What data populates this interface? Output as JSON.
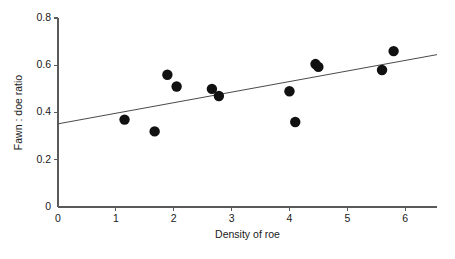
{
  "chart_data": {
    "type": "scatter",
    "title": "",
    "xlabel": "Density of roe",
    "ylabel": "Fawn : doe ratio",
    "xlim": [
      0,
      6.55
    ],
    "ylim": [
      0,
      0.8
    ],
    "grid": false,
    "legend": null,
    "xticks": [
      0,
      1,
      2,
      3,
      4,
      5,
      6
    ],
    "xtick_labels": [
      "0",
      "1",
      "2",
      "3",
      "4",
      "5",
      "6"
    ],
    "yticks": [
      0,
      0.2,
      0.4,
      0.6,
      0.8
    ],
    "ytick_labels": [
      "0",
      "0.2",
      "0.4",
      "0.6",
      "0.8"
    ],
    "marker_color": "#111111",
    "marker_size": 5.2,
    "points": [
      {
        "x": 1.15,
        "y": 0.37
      },
      {
        "x": 1.67,
        "y": 0.32
      },
      {
        "x": 1.89,
        "y": 0.56
      },
      {
        "x": 2.05,
        "y": 0.51
      },
      {
        "x": 2.66,
        "y": 0.5
      },
      {
        "x": 2.78,
        "y": 0.47
      },
      {
        "x": 4.0,
        "y": 0.49
      },
      {
        "x": 4.1,
        "y": 0.36
      },
      {
        "x": 4.45,
        "y": 0.605
      },
      {
        "x": 4.5,
        "y": 0.593
      },
      {
        "x": 5.6,
        "y": 0.58
      },
      {
        "x": 5.8,
        "y": 0.66
      }
    ],
    "trend_line": {
      "color": "#4a4a4a",
      "x_start": 0.0,
      "y_start": 0.352,
      "x_end": 6.55,
      "y_end": 0.645
    }
  }
}
